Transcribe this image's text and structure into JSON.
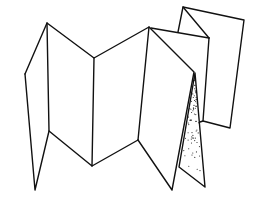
{
  "illustration": {
    "subject": "accordion-folded paper / leporello brochure line drawing",
    "stroke_color": "#111111",
    "background_color": "#ffffff",
    "shading": "stippled dots on inner fold"
  }
}
